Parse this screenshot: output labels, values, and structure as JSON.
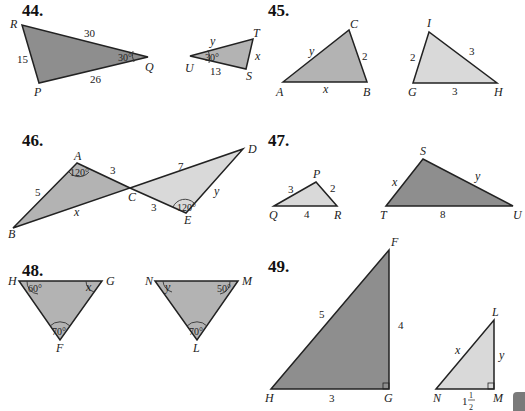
{
  "problems": [
    {
      "number": "44.",
      "figures": [
        {
          "vertices": {
            "R": "R",
            "P": "P",
            "Q": "Q"
          },
          "sides": {
            "RQ": "30",
            "RP": "15",
            "PQ": "26"
          },
          "angles": {
            "Q": "30°"
          }
        },
        {
          "vertices": {
            "T": "T",
            "U": "U",
            "S": "S"
          },
          "sides": {
            "UT": "y",
            "TS": "x",
            "US": "13"
          },
          "angles": {
            "U": "30°"
          }
        }
      ]
    },
    {
      "number": "45.",
      "figures": [
        {
          "vertices": {
            "A": "A",
            "B": "B",
            "C": "C"
          },
          "sides": {
            "AC": "y",
            "CB": "2",
            "AB": "x"
          }
        },
        {
          "vertices": {
            "I": "I",
            "G": "G",
            "H": "H"
          },
          "sides": {
            "GI": "2",
            "IH": "3",
            "GH": "3"
          }
        }
      ]
    },
    {
      "number": "46.",
      "figures": [
        {
          "vertices": {
            "A": "A",
            "B": "B",
            "C": "C"
          },
          "sides": {
            "AB": "5",
            "AC": "3",
            "BC": "x"
          },
          "angles": {
            "A": "120°"
          }
        },
        {
          "vertices": {
            "C": "C",
            "D": "D",
            "E": "E"
          },
          "sides": {
            "CD": "7",
            "CE": "3",
            "ED": "y"
          },
          "angles": {
            "E": "120°"
          }
        }
      ]
    },
    {
      "number": "47.",
      "figures": [
        {
          "vertices": {
            "P": "P",
            "Q": "Q",
            "R": "R"
          },
          "sides": {
            "QP": "3",
            "PR": "2",
            "QR": "4"
          }
        },
        {
          "vertices": {
            "S": "S",
            "T": "T",
            "U": "U"
          },
          "sides": {
            "TS": "x",
            "SU": "y",
            "TU": "8"
          }
        }
      ]
    },
    {
      "number": "48.",
      "figures": [
        {
          "vertices": {
            "H": "H",
            "G": "G",
            "F": "F"
          },
          "angles": {
            "H": "60°",
            "G": "x",
            "F": "70°"
          }
        },
        {
          "vertices": {
            "N": "N",
            "M": "M",
            "L": "L"
          },
          "angles": {
            "N": "y",
            "M": "50°",
            "L": "70°"
          }
        }
      ]
    },
    {
      "number": "49.",
      "figures": [
        {
          "vertices": {
            "F": "F",
            "G": "G",
            "H": "H"
          },
          "sides": {
            "HF": "5",
            "FG": "4",
            "HG": "3"
          }
        },
        {
          "vertices": {
            "L": "L",
            "M": "M",
            "N": "N"
          },
          "sides": {
            "NL": "x",
            "LM": "y",
            "NM_whole": "1",
            "NM_num": "1",
            "NM_den": "2"
          }
        }
      ]
    }
  ]
}
